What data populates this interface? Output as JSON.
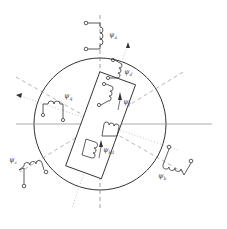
{
  "diagram": {
    "labels": {
      "psi_a": {
        "sym": "ψ",
        "sub": "a"
      },
      "psi_b": {
        "sym": "ψ",
        "sub": "b"
      },
      "psi_c": {
        "sym": "ψ",
        "sub": "c"
      },
      "psi_d": {
        "sym": "ψ",
        "sub": "d"
      },
      "psi_q": {
        "sym": "ψ",
        "sub": "q"
      },
      "psi_f": {
        "sym": "ψ",
        "sub": "f"
      },
      "psi_kd": {
        "sym": "ψ",
        "sub": "kd"
      }
    },
    "colors": {
      "line": "#333333",
      "dash": "#777777",
      "dot": "#999999"
    }
  }
}
